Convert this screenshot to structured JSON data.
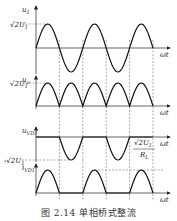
{
  "figure": {
    "caption": "图 2.14   单相桥式整流",
    "x_axis_label": "ωt",
    "panels": [
      {
        "id": "u1",
        "ylabel": "u",
        "ylabel_sub": "1",
        "level_label": "√2U",
        "level_label_sub": "1",
        "waveform": "sine",
        "level_position": "peak"
      },
      {
        "id": "uo",
        "ylabel": "u",
        "ylabel_sub": "o",
        "level_label": "√2U",
        "level_label_sub": "1",
        "waveform": "full-wave-rectified",
        "level_position": "peak"
      },
      {
        "id": "uVD1",
        "ylabel": "u",
        "ylabel_sub": "VD1",
        "level_label": "-√2U",
        "level_label_sub": "1",
        "waveform": "negative-half-waves",
        "level_position": "trough"
      },
      {
        "id": "iVD1",
        "ylabel": "i",
        "ylabel_sub": "VD1",
        "level_label_num": "√2U",
        "level_label_num_sub": "1",
        "level_label_den": "R",
        "level_label_den_sub": "L",
        "waveform": "positive-half-waves",
        "level_position": "peak"
      }
    ],
    "half_cycles_shown": 5
  }
}
